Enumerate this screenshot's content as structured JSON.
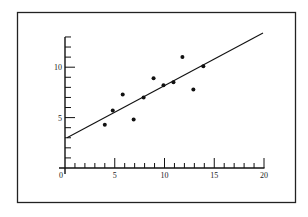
{
  "chart_data": {
    "type": "scatter",
    "title": "",
    "xlabel": "",
    "ylabel": "",
    "xlim": [
      0,
      20
    ],
    "ylim": [
      0,
      13
    ],
    "grid": false,
    "legend": null,
    "x_ticks": {
      "major": [
        0,
        5,
        10,
        15,
        20
      ],
      "minor_step": 1
    },
    "y_ticks": {
      "major": [
        5,
        10
      ],
      "minor_step": 1
    },
    "x_tick_labels": [
      "0",
      "5",
      "10",
      "15",
      "20"
    ],
    "y_tick_labels": [
      "5",
      "10"
    ],
    "series": [
      {
        "name": "observations",
        "points": [
          {
            "x": 4.0,
            "y": 4.3
          },
          {
            "x": 4.8,
            "y": 5.7
          },
          {
            "x": 5.8,
            "y": 7.3
          },
          {
            "x": 6.9,
            "y": 4.8
          },
          {
            "x": 7.9,
            "y": 7.0
          },
          {
            "x": 8.9,
            "y": 8.9
          },
          {
            "x": 9.9,
            "y": 8.2
          },
          {
            "x": 10.9,
            "y": 8.5
          },
          {
            "x": 11.8,
            "y": 11.0
          },
          {
            "x": 12.9,
            "y": 7.8
          },
          {
            "x": 13.9,
            "y": 10.1
          }
        ]
      }
    ],
    "fit_line": {
      "name": "regression line",
      "start": {
        "x": 0.2,
        "y": 3.0
      },
      "end": {
        "x": 19.9,
        "y": 13.4
      },
      "intercept": 2.9,
      "slope": 0.53
    }
  }
}
